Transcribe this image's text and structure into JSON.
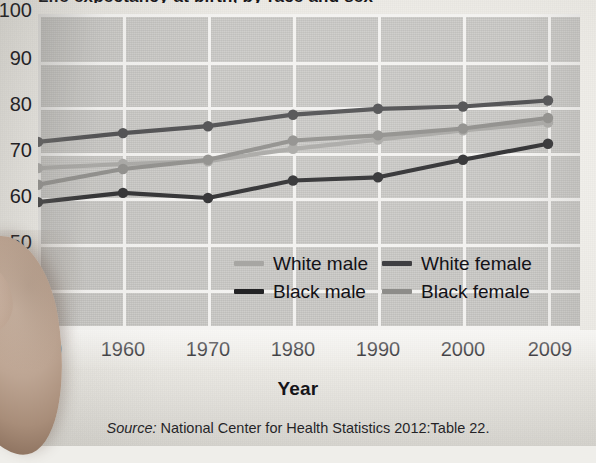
{
  "figure": {
    "title_cropped": "Life expectancy at birth, by race and sex",
    "xaxis_title": "Year",
    "source_label": "Source:",
    "source_text": " National Center for Health Statistics 2012:Table 22."
  },
  "colors": {
    "plot_background": "#c9c8c5",
    "gridline": "#f2f1ef",
    "white_male": "#a7a6a3",
    "white_female": "#4a4a4c",
    "black_male": "#2b2b2d",
    "black_female": "#8d8c89",
    "tick_text": "#131217"
  },
  "axes": {
    "y_ticks": [
      "100",
      "90",
      "80",
      "70",
      "60",
      "50",
      "40",
      "0"
    ],
    "x_ticks": [
      "1950",
      "1960",
      "1970",
      "1980",
      "1990",
      "2000",
      "2009"
    ],
    "y_break_between": [
      "0",
      "40"
    ]
  },
  "legend": {
    "items": [
      {
        "label": "White male",
        "color": "#a7a6a3"
      },
      {
        "label": "White female",
        "color": "#4a4a4c"
      },
      {
        "label": "Black male",
        "color": "#2b2b2d"
      },
      {
        "label": "Black female",
        "color": "#8d8c89"
      }
    ]
  },
  "chart_data": {
    "type": "line",
    "title": "Life expectancy at birth, by race and sex",
    "xlabel": "Year",
    "ylabel": "",
    "x": [
      1950,
      1960,
      1970,
      1980,
      1990,
      2000,
      2009
    ],
    "xtick_labels": [
      "1950",
      "1960",
      "1970",
      "1980",
      "1990",
      "2000",
      "2009"
    ],
    "ytick_labels": [
      "0",
      "40",
      "50",
      "60",
      "70",
      "80",
      "90",
      "100"
    ],
    "ylim": [
      40,
      100
    ],
    "y_axis_break": true,
    "grid": true,
    "legend_position": "inside-lower-center",
    "series": [
      {
        "name": "White female",
        "color": "#4a4a4c",
        "values": [
          72.2,
          74.1,
          75.6,
          78.1,
          79.4,
          79.9,
          81.2
        ]
      },
      {
        "name": "White male",
        "color": "#a7a6a3",
        "values": [
          66.5,
          67.4,
          68.0,
          70.7,
          72.7,
          74.7,
          76.4
        ]
      },
      {
        "name": "Black female",
        "color": "#8d8c89",
        "values": [
          62.9,
          66.3,
          68.3,
          72.5,
          73.6,
          75.1,
          77.4
        ]
      },
      {
        "name": "Black male",
        "color": "#2b2b2d",
        "values": [
          59.1,
          61.1,
          60.0,
          63.8,
          64.5,
          68.3,
          71.8
        ]
      }
    ]
  }
}
